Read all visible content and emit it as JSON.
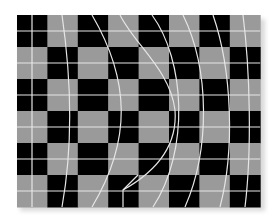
{
  "illusion": {
    "description": "Checkerboard with curved white lines (bulge illusion)",
    "grid": {
      "left": 17,
      "top": 15,
      "cols": 8,
      "rows": 6,
      "cell_w": 30.4,
      "cell_h": 32,
      "colors": {
        "dark": "#000000",
        "light": "#9a9a9a",
        "line": "#e6e6e6"
      }
    },
    "curves": [
      "M32,15 L32,207",
      "M62,15 C70,70 74,140 62,207",
      "M92,15 C130,80 132,140 92,207",
      "M120,15 C135,45 170,70 175,110 C178,150 150,175 123,190 L123,207",
      "M152,15 C185,60 190,150 153,207",
      "M183,15 C210,70 210,150 185,207",
      "M213,15 C232,70 235,150 220,207",
      "M243,15 C250,70 252,150 245,207"
    ]
  }
}
